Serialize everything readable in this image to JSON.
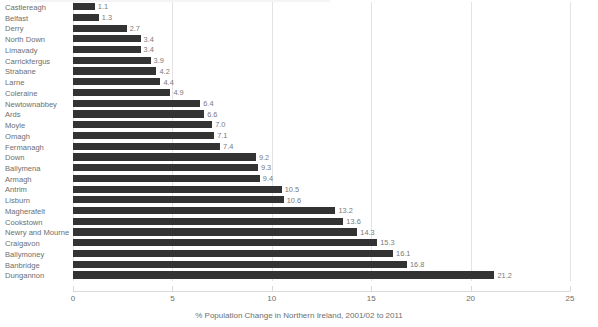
{
  "chart_data": {
    "type": "bar",
    "orientation": "horizontal",
    "title": "",
    "xlabel": "% Population Change in Northern Ireland, 2001/02 to 2011",
    "ylabel": "",
    "xlim": [
      0,
      25
    ],
    "xticks": [
      0,
      5,
      10,
      15,
      20,
      25
    ],
    "xtick_labels": [
      "0",
      "5",
      "10",
      "15",
      "20",
      "25"
    ],
    "grid": true,
    "legend": "none",
    "bar_color": "#333333",
    "label_color": "#6e6e6e",
    "gridline_color": "#e3e3e6",
    "categories": [
      "Castlereagh",
      "Belfast",
      "Derry",
      "North Down",
      "Limavady",
      "Carrickfergus",
      "Strabane",
      "Larne",
      "Coleraine",
      "Newtownabbey",
      "Ards",
      "Moyle",
      "Omagh",
      "Fermanagh",
      "Down",
      "Ballymena",
      "Armagh",
      "Antrim",
      "Lisburn",
      "Magherafelt",
      "Cookstown",
      "Newry and Mourne",
      "Craigavon",
      "Ballymoney",
      "Banbridge",
      "Dungannon"
    ],
    "values": [
      1.1,
      1.3,
      2.7,
      3.4,
      3.4,
      3.9,
      4.2,
      4.4,
      4.9,
      6.4,
      6.6,
      7.0,
      7.1,
      7.4,
      9.2,
      9.3,
      9.4,
      10.5,
      10.6,
      13.2,
      13.6,
      14.3,
      15.3,
      16.1,
      16.8,
      21.2
    ],
    "value_labels": [
      "1.1",
      "1.3",
      "2.7",
      "3.4",
      "3.4",
      "3.9",
      "4.2",
      "4.4",
      "4.9",
      "6.4",
      "6.6",
      "7.0",
      "7.1",
      "7.4",
      "9.2",
      "9.3",
      "9.4",
      "10.5",
      "10.6",
      "13.2",
      "13.6",
      "14.3",
      "15.3",
      "16.1",
      "16.8",
      "21.2"
    ]
  }
}
